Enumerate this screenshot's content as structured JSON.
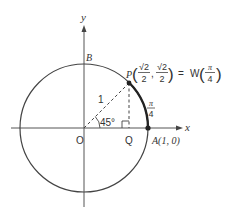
{
  "diagram": {
    "type": "unit-circle",
    "colors": {
      "stroke": "#3a3a3a",
      "background": "#ffffff"
    },
    "axes": {
      "x_label": "x",
      "y_label": "y"
    },
    "points": {
      "origin": {
        "label": "O"
      },
      "B": {
        "label": "B"
      },
      "A": {
        "label": "A(1, 0)"
      },
      "Q": {
        "label": "Q"
      },
      "P": {
        "label": "P",
        "coord_x_num": "√2",
        "coord_x_den": "2",
        "coord_y_num": "√2",
        "coord_y_den": "2",
        "equals": "=",
        "func": "W",
        "arg_num": "π",
        "arg_den": "4"
      }
    },
    "radius_label": "1",
    "angle_label": "45°",
    "arc_label_num": "π",
    "arc_label_den": "4"
  }
}
